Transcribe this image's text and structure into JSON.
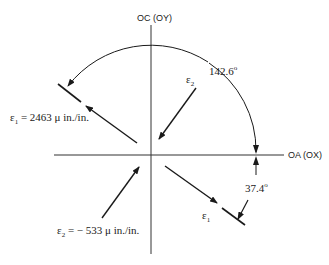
{
  "diagram": {
    "axes": {
      "vertical_label": "OC (OY)",
      "horizontal_label": "OA (OX)"
    },
    "angles": {
      "large_arc_value": "142.6",
      "small_arc_value": "37.4",
      "degree_symbol": "o"
    },
    "strains": {
      "e1_symbol": "ε",
      "e1_subscript": "1",
      "e1_value_text": " = 2463 μ in./in.",
      "e2_symbol": "ε",
      "e2_subscript": "2",
      "e2_value_text": " = − 533 μ in./in."
    },
    "arrow_labels": {
      "e2_symbol": "ε",
      "e2_subscript": "2",
      "e1_symbol": "ε",
      "e1_subscript": "1"
    },
    "colors": {
      "line": "#1a1a1a",
      "axis": "#333333",
      "background": "#ffffff"
    }
  }
}
